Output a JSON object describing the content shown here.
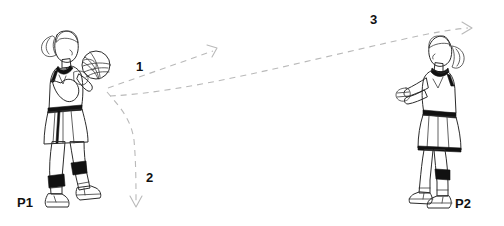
{
  "diagram": {
    "background_color": "#ffffff",
    "line_color": "#2b2b2b",
    "path_color": "#b9b9b9",
    "label_color": "#111111"
  },
  "players": [
    {
      "id": "p1",
      "label": "P1",
      "role": "passer",
      "holding_ball": true,
      "facing": "right",
      "ball_name": "volleyball"
    },
    {
      "id": "p2",
      "label": "P2",
      "role": "receiver",
      "holding_ball": false,
      "facing": "left",
      "ball_name": null
    }
  ],
  "paths": [
    {
      "id": "path-1",
      "label": "1",
      "description": "pass from P1 upward to the right",
      "has_arrowhead": true,
      "style": "dashed"
    },
    {
      "id": "path-2",
      "label": "2",
      "description": "player movement curving down",
      "has_arrowhead": true,
      "style": "dashed"
    },
    {
      "id": "path-3",
      "label": "3",
      "description": "long arcing pass to P2",
      "has_arrowhead": true,
      "style": "dashed"
    }
  ]
}
